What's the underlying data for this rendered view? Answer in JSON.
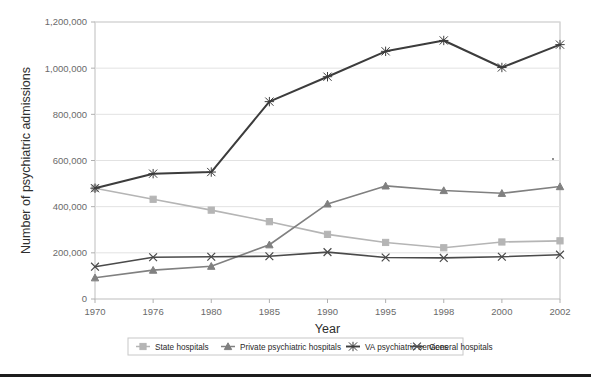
{
  "chart_data": {
    "type": "line",
    "title": "",
    "xlabel": "Year",
    "ylabel": "Number of psychiatric admissions",
    "categories": [
      "1970",
      "1976",
      "1980",
      "1985",
      "1990",
      "1995",
      "1998",
      "2000",
      "2002"
    ],
    "ylim": [
      0,
      1200000
    ],
    "ytick_labels": [
      "0",
      "200,000",
      "400,000",
      "600,000",
      "800,000",
      "1,000,000",
      "1,200,000"
    ],
    "ytick_values": [
      0,
      200000,
      400000,
      600000,
      800000,
      1000000,
      1200000
    ],
    "grid": "horizontal",
    "legend_position": "bottom",
    "series": [
      {
        "name": "State hospitals",
        "color": "#b5b5b5",
        "marker": "square",
        "values": [
          480000,
          432000,
          385000,
          335000,
          280000,
          245000,
          222000,
          247000,
          252000
        ]
      },
      {
        "name": "Private psychiatric hospitals",
        "color": "#808080",
        "marker": "triangle",
        "values": [
          92000,
          125000,
          142000,
          235000,
          412000,
          490000,
          470000,
          458000,
          487000
        ]
      },
      {
        "name": "VA psychiatric services",
        "color": "#3c3c3c",
        "marker": "asterisk",
        "values": [
          480000,
          543000,
          550000,
          855000,
          963000,
          1073000,
          1120000,
          1003000,
          1102000
        ]
      },
      {
        "name": "General hospitals",
        "color": "#4a4a4a",
        "marker": "x",
        "values": [
          140000,
          181000,
          183000,
          185000,
          203000,
          180000,
          178000,
          183000,
          192000
        ]
      }
    ]
  },
  "legend": {
    "items": [
      {
        "label": "State hospitals"
      },
      {
        "label": "Private psychiatric hospitals"
      },
      {
        "label": "VA psychiatric services"
      },
      {
        "label": "General hospitals"
      }
    ]
  }
}
